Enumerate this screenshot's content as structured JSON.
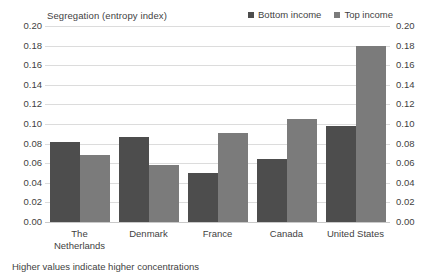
{
  "chart_data": {
    "type": "bar",
    "title": "Segregation (entropy index)",
    "xlabel": "",
    "ylabel": "",
    "ylim": [
      0.0,
      0.2
    ],
    "ytick_step": 0.02,
    "ytick_labels": [
      "0.20",
      "0.18",
      "0.16",
      "0.14",
      "0.12",
      "0.10",
      "0.08",
      "0.06",
      "0.04",
      "0.02",
      "0.00"
    ],
    "ytick_values": [
      0.2,
      0.18,
      0.16,
      0.14,
      0.12,
      0.1,
      0.08,
      0.06,
      0.04,
      0.02,
      0.0
    ],
    "dual_axis": true,
    "grid": true,
    "legend_position": "top-right",
    "categories": [
      "The Netherlands",
      "Denmark",
      "France",
      "Canada",
      "United States"
    ],
    "category_lines": [
      [
        "The",
        "Netherlands"
      ],
      [
        "Denmark"
      ],
      [
        "France"
      ],
      [
        "Canada"
      ],
      [
        "United States"
      ]
    ],
    "series": [
      {
        "name": "Bottom income",
        "color": "#4d4d4d",
        "values": [
          0.082,
          0.087,
          0.05,
          0.064,
          0.098
        ]
      },
      {
        "name": "Top income",
        "color": "#7b7b7b",
        "values": [
          0.068,
          0.058,
          0.091,
          0.105,
          0.18
        ]
      }
    ],
    "annotations": [
      "Higher values indicate higher concentrations"
    ]
  },
  "footnote": "Higher values indicate higher concentrations",
  "colors": {
    "bottom_income": "#4d4d4d",
    "top_income": "#7b7b7b",
    "gridline": "#dcdcdc",
    "text": "#3f3f3f",
    "background": "#ffffff"
  }
}
